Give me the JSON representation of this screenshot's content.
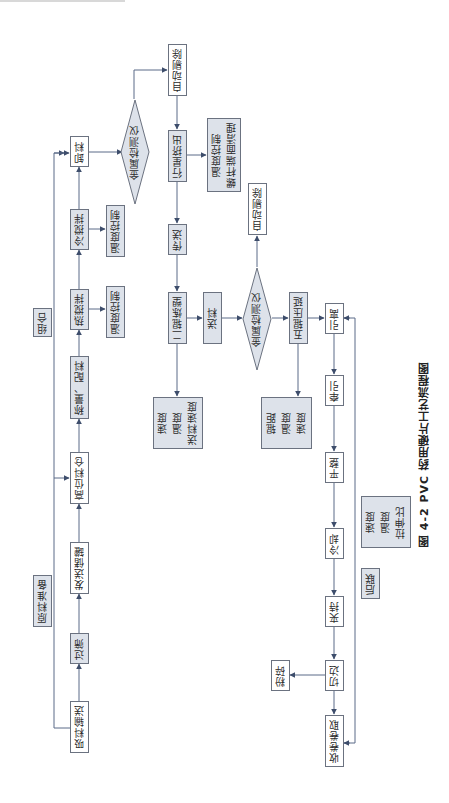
{
  "figure": {
    "caption": "图 4-2   PVC 药用硬片工艺流程图"
  },
  "stages": {
    "raw_material_prep": "原料准备",
    "combination": "组合",
    "post_link": "后联"
  },
  "column_a": {
    "suction_conveying": "吸料输送",
    "screening": "过筛",
    "send_storage_tank": "发送储罐",
    "high_level_silo": "高位料仓",
    "weighing_batching": "称量、配料",
    "hot_mixing": "热搅拌",
    "cold_mixing": "冷搅拌",
    "unloading": "卸料"
  },
  "side_controls": {
    "hot_mix_temp": "温度控制",
    "cold_mix_temp": "温度控制",
    "extruder_controls": [
      "温度控制",
      "螺杆端面清理"
    ]
  },
  "column_b": {
    "metal_detector_1": "金属检测仪",
    "auto_reject_1": "自动剔除",
    "planetary_extrusion": "行星挤出",
    "conveying": "传送",
    "two_roll_plasticizing": "二辊炼塑",
    "feeding": "送料",
    "metal_detector_2": "金属检测仪",
    "auto_reject_2": "自动剔除",
    "five_roll_calendering": "五辊压延"
  },
  "param_boxes": {
    "two_roll_params": [
      "速度",
      "温度",
      "送料速度"
    ],
    "five_roll_params": [
      "辊距",
      "温度",
      "速度"
    ],
    "post_params": [
      "速度",
      "温度",
      "拉伸比"
    ]
  },
  "column_c": {
    "take_off": "引离",
    "traction": "牵引",
    "flattening": "平整",
    "cooling": "冷却",
    "clamping": "夹持",
    "edge_trimming": "切边",
    "winding": "收卷卷取",
    "crushing": "粉碎"
  },
  "colors": {
    "line": "#4a5a78",
    "box_border": "#6b7280",
    "grey_fill": "#dde2ea",
    "white_fill": "#ffffff"
  }
}
